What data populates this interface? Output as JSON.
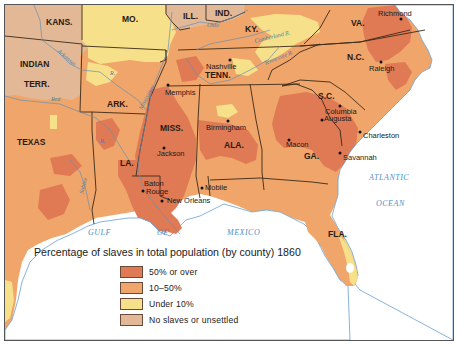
{
  "map": {
    "title": "Percentage of slaves in total population (by county) 1860",
    "colors": {
      "fifty_or_over": "#e07a55",
      "ten_to_fifty": "#f0a56a",
      "under_ten": "#f7e08a",
      "no_slaves": "#e3b896",
      "water": "#ffffff",
      "border": "#3a2a1a",
      "river": "#6a8fb0"
    },
    "states": [
      {
        "id": "kans",
        "label": "KANS."
      },
      {
        "id": "mo",
        "label": "MO."
      },
      {
        "id": "ill",
        "label": "ILL."
      },
      {
        "id": "ind",
        "label": "IND."
      },
      {
        "id": "ky",
        "label": "KY."
      },
      {
        "id": "va",
        "label": "VA."
      },
      {
        "id": "indian_terr_1",
        "label": "INDIAN"
      },
      {
        "id": "indian_terr_2",
        "label": "TERR."
      },
      {
        "id": "tenn",
        "label": "TENN."
      },
      {
        "id": "nc",
        "label": "N.C."
      },
      {
        "id": "ark",
        "label": "ARK."
      },
      {
        "id": "sc",
        "label": "S.C."
      },
      {
        "id": "miss",
        "label": "MISS."
      },
      {
        "id": "ala",
        "label": "ALA."
      },
      {
        "id": "texas",
        "label": "TEXAS"
      },
      {
        "id": "la",
        "label": "LA."
      },
      {
        "id": "ga",
        "label": "GA."
      },
      {
        "id": "fla",
        "label": "FLA."
      }
    ],
    "cities": [
      {
        "id": "richmond",
        "label": "Richmond"
      },
      {
        "id": "nashville",
        "label": "Nashville"
      },
      {
        "id": "raleigh",
        "label": "Raleigh"
      },
      {
        "id": "memphis",
        "label": "Memphis"
      },
      {
        "id": "columbia",
        "label": "Columbia"
      },
      {
        "id": "augusta",
        "label": "Augusta"
      },
      {
        "id": "birmingham",
        "label": "Birmingham"
      },
      {
        "id": "charleston",
        "label": "Charleston"
      },
      {
        "id": "jackson",
        "label": "Jackson"
      },
      {
        "id": "macon",
        "label": "Macon"
      },
      {
        "id": "savannah",
        "label": "Savannah"
      },
      {
        "id": "baton_rouge_1",
        "label": "Baton"
      },
      {
        "id": "baton_rouge_2",
        "label": "Rouge"
      },
      {
        "id": "mobile",
        "label": "Mobile"
      },
      {
        "id": "new_orleans",
        "label": "New Orleans"
      }
    ],
    "rivers": [
      {
        "id": "ohio",
        "label": "Ohio"
      },
      {
        "id": "cumberland",
        "label": "Cumberland R."
      },
      {
        "id": "tennessee",
        "label": "Tennessee R."
      },
      {
        "id": "arkansas",
        "label": "Arkansas"
      },
      {
        "id": "mississippi",
        "label": "Mississippi"
      },
      {
        "id": "red",
        "label": "Red"
      },
      {
        "id": "sabine",
        "label": "Sabine"
      },
      {
        "id": "r_ark",
        "label": "R."
      },
      {
        "id": "r_la",
        "label": "R."
      }
    ],
    "water_bodies": [
      {
        "id": "gulf",
        "label": "GULF"
      },
      {
        "id": "of",
        "label": "OF"
      },
      {
        "id": "mexico",
        "label": "MEXICO"
      },
      {
        "id": "atlantic",
        "label": "ATLANTIC"
      },
      {
        "id": "ocean",
        "label": "OCEAN"
      }
    ],
    "legend": [
      {
        "key": "fifty_or_over",
        "label": "50% or over",
        "color": "#e07a55"
      },
      {
        "key": "ten_to_fifty",
        "label": "10–50%",
        "color": "#f0a56a"
      },
      {
        "key": "under_ten",
        "label": "Under 10%",
        "color": "#f7e08a"
      },
      {
        "key": "no_slaves",
        "label": "No slaves or unsettled",
        "color": "#e3b896"
      }
    ]
  }
}
